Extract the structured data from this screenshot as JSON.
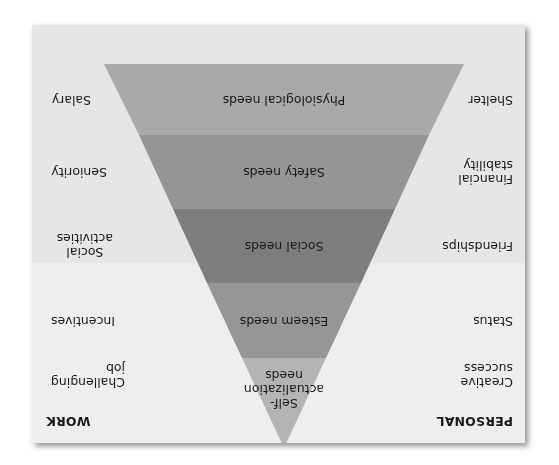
{
  "diagram": {
    "orientation": "rotated 180 degrees",
    "columns": {
      "personal_header": "PERSONAL",
      "work_header": "WORK"
    },
    "levels": [
      {
        "name": "Self-actualization needs",
        "lines": [
          "Self-",
          "actualization",
          "needs"
        ],
        "personal": [
          "Creative",
          "success"
        ],
        "work": [
          "Challenging",
          "job"
        ],
        "color": "#b4b4b4"
      },
      {
        "name": "Esteem needs",
        "lines": [
          "Esteem needs"
        ],
        "personal": [
          "Status"
        ],
        "work": [
          "Incentives"
        ],
        "color": "#969696"
      },
      {
        "name": "Social needs",
        "lines": [
          "Social needs"
        ],
        "personal": [
          "Friendships"
        ],
        "work": [
          "Social",
          "activities"
        ],
        "color": "#7d7d7d"
      },
      {
        "name": "Safety needs",
        "lines": [
          "Safety needs"
        ],
        "personal": [
          "Financial",
          "stability"
        ],
        "work": [
          "Seniority"
        ],
        "color": "#959595"
      },
      {
        "name": "Physiological needs",
        "lines": [
          "Physiological needs"
        ],
        "personal": [
          "Shelter"
        ],
        "work": [
          "Salary"
        ],
        "color": "#a9a9a9"
      }
    ],
    "colors": {
      "card_background": "#e6e6e6",
      "lower_section_background": "#eeeeee",
      "text": "#1a1a1a"
    }
  }
}
